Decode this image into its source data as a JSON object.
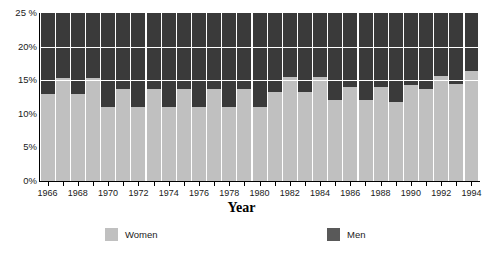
{
  "chart_data": {
    "type": "bar",
    "title": "",
    "subtitle": "",
    "xlabel": "Year",
    "ylabel": "",
    "stacked": true,
    "grid": true,
    "gridlines_y": [
      15,
      20
    ],
    "legend_position": "bottom",
    "ylim": [
      0,
      25
    ],
    "yticks": [
      0,
      5,
      10,
      15,
      20,
      25
    ],
    "ytick_labels": [
      "0%",
      "5%",
      "10%",
      "15%",
      "20%",
      "25 %"
    ],
    "categories": [
      "1966",
      "1967",
      "1968",
      "1969",
      "1970",
      "1971",
      "1972",
      "1973",
      "1974",
      "1975",
      "1976",
      "1977",
      "1978",
      "1979",
      "1980",
      "1981",
      "1982",
      "1983",
      "1984",
      "1985",
      "1986",
      "1987",
      "1988",
      "1989",
      "1990",
      "1991",
      "1992",
      "1993",
      "1994"
    ],
    "xtick_labels_shown": [
      "1966",
      "1968",
      "1970",
      "1972",
      "1974",
      "1976",
      "1978",
      "1980",
      "1982",
      "1984",
      "1986",
      "1988",
      "1990",
      "1992",
      "1994"
    ],
    "series": [
      {
        "name": "Women",
        "color": "#c0c0c0",
        "values": [
          13.0,
          15.3,
          13.0,
          15.3,
          11.0,
          13.7,
          11.0,
          13.7,
          11.0,
          13.7,
          11.0,
          13.7,
          11.0,
          13.7,
          11.0,
          13.2,
          15.5,
          13.2,
          15.5,
          12.0,
          14.0,
          12.0,
          14.0,
          11.8,
          14.3,
          13.7,
          15.7,
          14.5,
          16.3
        ]
      },
      {
        "name": "Men",
        "color": "#3a3a3a",
        "values": [
          12.0,
          9.7,
          12.0,
          9.7,
          14.0,
          11.3,
          14.0,
          11.3,
          14.0,
          11.3,
          14.0,
          11.3,
          14.0,
          11.3,
          14.0,
          11.8,
          9.5,
          11.8,
          9.5,
          13.0,
          11.0,
          13.0,
          11.0,
          13.2,
          10.7,
          11.3,
          9.3,
          10.5,
          8.7
        ]
      }
    ]
  },
  "axis": {
    "x_title": "Year"
  },
  "legend": {
    "items": [
      {
        "label": "Women",
        "color": "#c0c0c0"
      },
      {
        "label": "Men",
        "color": "#595959"
      }
    ]
  },
  "colors": {
    "women": "#c0c0c0",
    "men": "#3a3a3a",
    "men_legend": "#595959",
    "gridline": "#ffffff",
    "axis": "#000000",
    "text": "#1a1a1a",
    "background": "#ffffff"
  }
}
